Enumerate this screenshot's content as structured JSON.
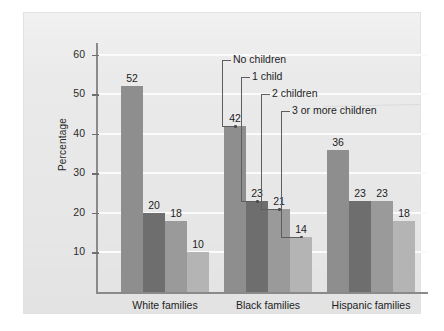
{
  "chart_data": {
    "type": "bar",
    "title": "",
    "xlabel": "",
    "ylabel": "Percentage",
    "categories": [
      "White families",
      "Black families",
      "Hispanic families"
    ],
    "series": [
      {
        "name": "No children",
        "values": [
          52,
          42,
          36
        ],
        "color": "#8e8e8e"
      },
      {
        "name": "1 child",
        "values": [
          20,
          23,
          23
        ],
        "color": "#6e6e6e"
      },
      {
        "name": "2 children",
        "values": [
          18,
          21,
          23
        ],
        "color": "#9a9a9a"
      },
      {
        "name": "3 or more children",
        "values": [
          10,
          14,
          18
        ],
        "color": "#b4b4b4"
      }
    ],
    "ylim": [
      0,
      63
    ],
    "yticks": [
      10,
      20,
      30,
      40,
      50,
      60
    ],
    "ytick_labels": [
      "10",
      "20",
      "30",
      "40",
      "50",
      "60"
    ],
    "grid": true,
    "legend_position": "inline-leader-lines",
    "data_labels": true,
    "background_color": "#eaeaea",
    "gridline_color": "#fbfbfb",
    "axis_color": "#8a8a8a"
  },
  "axis": {
    "y_title": "Percentage"
  },
  "annotations": {
    "leaders": [
      {
        "label": "No children"
      },
      {
        "label": "1 child"
      },
      {
        "label": "2 children"
      },
      {
        "label": "3 or more children"
      }
    ]
  }
}
